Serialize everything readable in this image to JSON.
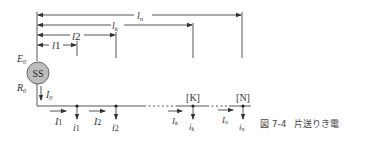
{
  "figure": {
    "caption_number": "図 7-4",
    "caption_title": "片送りき電"
  },
  "source": {
    "symbol": "SS",
    "emf_label": "E",
    "emf_sub": "0",
    "resistance_label": "R",
    "resistance_sub": "0",
    "current_label": "I",
    "current_sub": "0"
  },
  "distances": [
    {
      "label": "l",
      "sub": "1"
    },
    {
      "label": "l",
      "sub": "2"
    },
    {
      "label": "l",
      "sub": "k"
    },
    {
      "label": "l",
      "sub": "n"
    }
  ],
  "segment_currents": [
    {
      "label": "I",
      "sub": "1"
    },
    {
      "label": "I",
      "sub": "2"
    },
    {
      "label": "I",
      "sub": "k"
    },
    {
      "label": "I",
      "sub": "n"
    }
  ],
  "load_currents": [
    {
      "label": "i",
      "sub": "1"
    },
    {
      "label": "i",
      "sub": "2"
    },
    {
      "label": "i",
      "sub": "k"
    },
    {
      "label": "i",
      "sub": "n"
    }
  ],
  "node_tags": {
    "k": "[K]",
    "n": "[N]"
  },
  "colors": {
    "line": "#555555",
    "circle_fill": "#bdbdbd",
    "text": "#333333"
  }
}
